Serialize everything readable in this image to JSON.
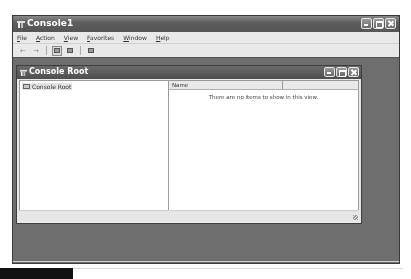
{
  "window": {
    "title": "Console1",
    "icon": "mmc-console-icon",
    "caption_buttons": [
      "minimize",
      "maximize",
      "close"
    ]
  },
  "menubar": {
    "items": [
      "File",
      "Action",
      "View",
      "Favorites",
      "Window",
      "Help"
    ]
  },
  "toolbar": {
    "buttons": [
      {
        "name": "back",
        "glyph": "←"
      },
      {
        "name": "forward",
        "glyph": "→"
      },
      {
        "name": "show-hide-console-tree",
        "glyph": ""
      },
      {
        "name": "export-list",
        "glyph": ""
      },
      {
        "name": "help",
        "glyph": ""
      }
    ]
  },
  "child_window": {
    "title": "Console Root",
    "caption_buttons": [
      "minimize",
      "maximize",
      "close"
    ],
    "tree": {
      "items": [
        {
          "label": "Console Root",
          "selected": true
        }
      ]
    },
    "list": {
      "columns": [
        "Name",
        ""
      ],
      "empty_message": "There are no items to show in this view."
    }
  }
}
